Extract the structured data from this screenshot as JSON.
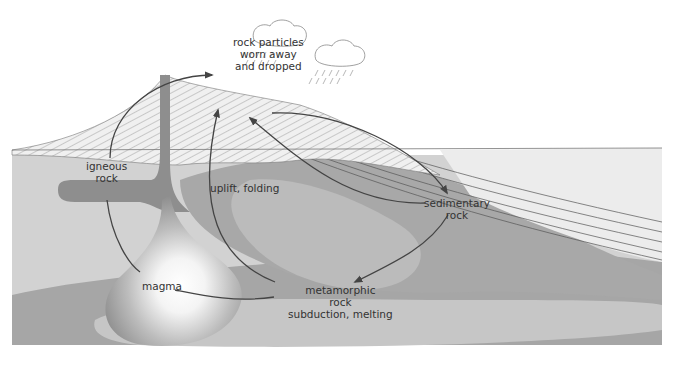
{
  "diagram": {
    "colors": {
      "background": "#ffffff",
      "crust_light": "#d4d4d4",
      "crust_mid": "#a8a8a8",
      "crust_dark": "#9a9a9a",
      "magma_core": "#ffffff",
      "magma_edge": "#8e8e8e",
      "sea": "#eeeeee",
      "arrow": "#444444",
      "strata_line": "#555555"
    },
    "labels": {
      "rock_particles": [
        "rock particles",
        "worn away",
        "and dropped"
      ],
      "igneous": [
        "igneous",
        "rock"
      ],
      "uplift": "uplift, folding",
      "sedimentary": [
        "sedimentary",
        "rock"
      ],
      "magma": "magma",
      "metamorphic": [
        "metamorphic",
        "rock",
        "subduction, melting"
      ]
    },
    "nodes": [
      {
        "id": "igneous",
        "label": "igneous rock"
      },
      {
        "id": "erosion",
        "label": "rock particles worn away and dropped"
      },
      {
        "id": "sedimentary",
        "label": "sedimentary rock"
      },
      {
        "id": "metamorphic",
        "label": "metamorphic rock"
      },
      {
        "id": "magma",
        "label": "magma"
      }
    ],
    "edges": [
      {
        "from": "igneous",
        "to": "erosion"
      },
      {
        "from": "erosion",
        "to": "sedimentary"
      },
      {
        "from": "sedimentary",
        "to": "erosion"
      },
      {
        "from": "sedimentary",
        "to": "metamorphic"
      },
      {
        "from": "metamorphic",
        "to": "erosion",
        "label": "uplift, folding"
      },
      {
        "from": "metamorphic",
        "to": "magma",
        "label": "subduction, melting"
      },
      {
        "from": "igneous",
        "to": "magma"
      }
    ]
  }
}
